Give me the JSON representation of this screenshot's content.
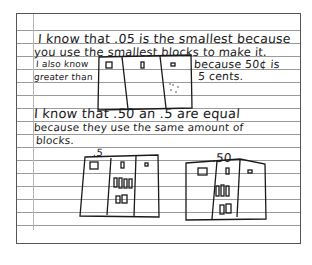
{
  "document": {
    "type": "handwritten student work on lined paper",
    "lines": [
      "I know that .05 is the smallest because",
      "you use the smallest blocks to make it.",
      "I also know",
      "greater than",
      "because 50¢ is",
      "5 cents.",
      "I know that .50 an .5 are equal",
      "because they use the same amount of",
      "blocks."
    ],
    "drawing_labels": [
      ".5",
      ".50"
    ]
  }
}
